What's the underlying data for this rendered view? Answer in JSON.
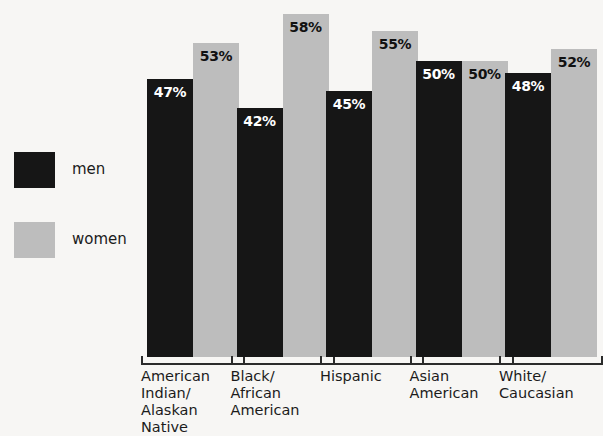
{
  "legend": {
    "items": [
      {
        "label": "men",
        "color": "#161616",
        "name": "men"
      },
      {
        "label": "women",
        "color": "#bdbdbd",
        "name": "women"
      }
    ]
  },
  "chart_data": {
    "type": "bar",
    "title": "",
    "xlabel": "",
    "ylabel": "",
    "ylim": [
      0,
      60
    ],
    "grid": false,
    "legend_position": "left",
    "categories": [
      "American Indian/ Alaskan Native",
      "Black/ African American",
      "Hispanic",
      "Asian American",
      "White/ Caucasian"
    ],
    "category_lines": [
      [
        "American",
        "Indian/",
        "Alaskan",
        "Native"
      ],
      [
        "Black/",
        "African",
        "American"
      ],
      [
        "Hispanic"
      ],
      [
        "Asian",
        "American"
      ],
      [
        "White/",
        "Caucasian"
      ]
    ],
    "series": [
      {
        "name": "men",
        "color": "#161616",
        "values": [
          47,
          42,
          45,
          50,
          48
        ],
        "labels": [
          "47%",
          "42%",
          "45%",
          "50%",
          "48%"
        ]
      },
      {
        "name": "women",
        "color": "#bdbdbd",
        "values": [
          53,
          58,
          55,
          50,
          52
        ],
        "labels": [
          "53%",
          "58%",
          "55%",
          "50%",
          "52%"
        ]
      }
    ]
  },
  "colors": {
    "background": "#f7f6f4",
    "men": "#161616",
    "women": "#bdbdbd",
    "axis": "#2b2b2b",
    "text": "#1b1b1b"
  }
}
